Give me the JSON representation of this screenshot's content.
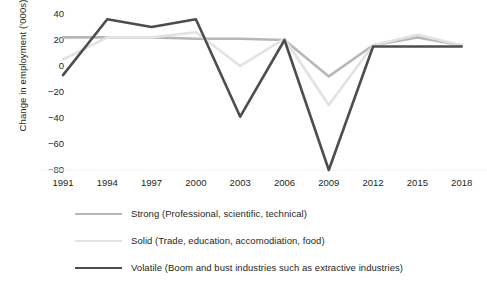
{
  "chart_data": {
    "type": "line",
    "title": "",
    "xlabel": "",
    "ylabel": "Change in employment ('000s)",
    "x": [
      1991,
      1994,
      1997,
      2000,
      2003,
      2006,
      2009,
      2012,
      2015,
      2018
    ],
    "xticklabels": [
      "1991",
      "1994",
      "1997",
      "2000",
      "2003",
      "2006",
      "2009",
      "2012",
      "2015",
      "2018"
    ],
    "yticklabels": [
      "40",
      "20",
      "0",
      "-20",
      "-40",
      "-60",
      "-80"
    ],
    "yticks": [
      40,
      20,
      0,
      -20,
      -40,
      -60,
      -80
    ],
    "ylim": [
      -88,
      45
    ],
    "xlim": [
      1990,
      2019
    ],
    "grid": false,
    "legend_position": "below",
    "series": [
      {
        "name": "Strong (Professional, scientific, technical)",
        "color": "#b7b7b7",
        "width": 2.6,
        "values": [
          22,
          22,
          22,
          21,
          21,
          20,
          -8,
          16,
          22,
          16
        ]
      },
      {
        "name": "Solid (Trade, education, accomodiation, food)",
        "color": "#e2e2e2",
        "width": 2.6,
        "values": [
          5,
          22,
          22,
          26,
          0,
          21,
          -30,
          16,
          24,
          16
        ]
      },
      {
        "name": "Volatile (Boom and bust industries such as extractive industries)",
        "color": "#4d4d4d",
        "width": 2.6,
        "values": [
          -7,
          36,
          30,
          36,
          -39,
          20,
          -80,
          15,
          15,
          15
        ]
      }
    ]
  },
  "legend": {
    "items": [
      {
        "label": "Strong (Professional, scientific, technical)",
        "color": "#b7b7b7"
      },
      {
        "label": "Solid (Trade, education, accomodiation, food)",
        "color": "#e2e2e2"
      },
      {
        "label": "Volatile (Boom and bust industries such as extractive industries)",
        "color": "#4d4d4d"
      }
    ]
  }
}
